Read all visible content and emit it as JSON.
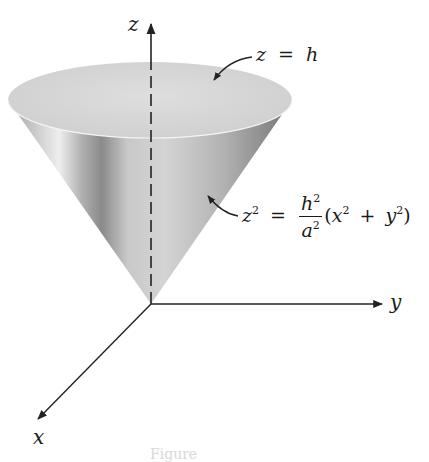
{
  "figure": {
    "type": "3d-surface-diagram",
    "axes": {
      "z": {
        "label": "z"
      },
      "y": {
        "label": "y"
      },
      "x": {
        "label": "x"
      }
    },
    "annotations": [
      {
        "id": "top-plane",
        "text_parts": {
          "var": "z",
          "eq": "=",
          "rhs": "h"
        },
        "points_to": "top disk of cone"
      },
      {
        "id": "cone-surface",
        "text_parts": {
          "lhs": "z",
          "lhs_exp": "2",
          "eq": "=",
          "num": "h",
          "num_exp": "2",
          "den": "a",
          "den_exp": "2",
          "open": "(",
          "x": "x",
          "x_exp": "2",
          "plus": "+",
          "y": "y",
          "y_exp": "2",
          "close": ")"
        },
        "points_to": "lateral surface of cone"
      }
    ],
    "caption": "Figure"
  },
  "colors": {
    "background": "#ffffff",
    "axis": "#222222",
    "cone_light": "#e6e6e6",
    "cone_mid": "#b8b8b8",
    "cone_dark": "#6e6e6e",
    "top_disk": "#d9d9d9"
  }
}
